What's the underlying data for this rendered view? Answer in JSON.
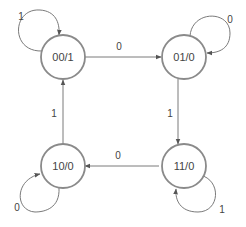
{
  "diagram": {
    "type": "state-machine",
    "colors": {
      "stroke": "#8a8a8a",
      "edge": "#7a7a7a",
      "text": "#444444",
      "background": "#ffffff"
    },
    "states": [
      {
        "id": "s00",
        "label": "00/1"
      },
      {
        "id": "s01",
        "label": "01/0"
      },
      {
        "id": "s10",
        "label": "10/0"
      },
      {
        "id": "s11",
        "label": "11/0"
      }
    ],
    "transitions": [
      {
        "from": "00/1",
        "to": "00/1",
        "label": "1"
      },
      {
        "from": "00/1",
        "to": "01/0",
        "label": "0"
      },
      {
        "from": "01/0",
        "to": "01/0",
        "label": "0"
      },
      {
        "from": "01/0",
        "to": "11/0",
        "label": "1"
      },
      {
        "from": "11/0",
        "to": "11/0",
        "label": "1"
      },
      {
        "from": "11/0",
        "to": "10/0",
        "label": "0"
      },
      {
        "from": "10/0",
        "to": "10/0",
        "label": "0"
      },
      {
        "from": "10/0",
        "to": "00/1",
        "label": "1"
      }
    ]
  }
}
